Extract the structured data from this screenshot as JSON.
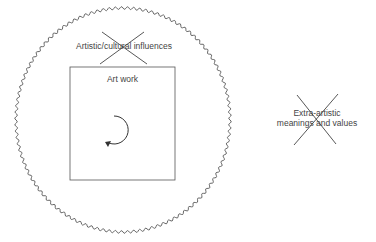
{
  "diagram": {
    "outer_region": {
      "label": "Artistic/cultural influences",
      "crossed_out": true
    },
    "inner_box": {
      "label": "Art work",
      "symbol": "circular-arrow-counterclockwise"
    },
    "external": {
      "label_line1": "Extra-artistic",
      "label_line2": "meanings and values",
      "crossed_out": true
    }
  },
  "colors": {
    "stroke": "#333333",
    "text": "#444444",
    "background": "#ffffff"
  }
}
